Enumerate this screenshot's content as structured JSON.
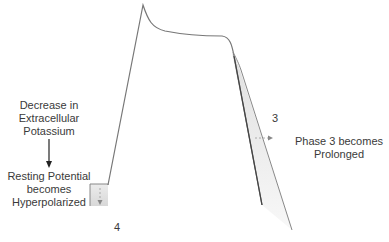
{
  "diagram": {
    "left_note": {
      "cause": [
        "Decrease in",
        "Extracellular",
        "Potassium"
      ],
      "effect": [
        "Resting Potential",
        "becomes",
        "Hyperpolarized"
      ]
    },
    "right_note": [
      "Phase 3 becomes",
      "Prolonged"
    ],
    "phase_labels": {
      "phase3": "3",
      "phase4": "4"
    },
    "colors": {
      "trace": "#8a8a8a",
      "trace_dark": "#555555",
      "shade": "#e6e6e6",
      "text": "#3a3a3a"
    }
  }
}
